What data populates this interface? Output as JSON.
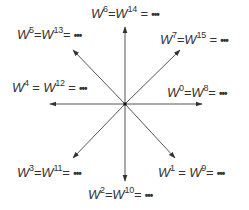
{
  "diagram": {
    "type": "unit-circle-roots",
    "center": {
      "x": 125,
      "y": 104
    },
    "line_color": "#555555",
    "center_dot_color": "#111111",
    "arrows": [
      {
        "direction": "right",
        "angle_deg": 0
      },
      {
        "direction": "lower-right",
        "angle_deg": -45
      },
      {
        "direction": "down",
        "angle_deg": -90
      },
      {
        "direction": "lower-left",
        "angle_deg": -135
      },
      {
        "direction": "left",
        "angle_deg": 180
      },
      {
        "direction": "upper-left",
        "angle_deg": 135
      },
      {
        "direction": "up",
        "angle_deg": 90
      },
      {
        "direction": "upper-right",
        "angle_deg": 45
      }
    ],
    "labels": [
      {
        "id": "w0",
        "base": "W",
        "exp1": "0",
        "exp2": "8",
        "eq": "=",
        "ellipsis": "•••"
      },
      {
        "id": "w1",
        "base": "W",
        "exp1": "1",
        "exp2": "9",
        "eq": "=",
        "ellipsis": "•••"
      },
      {
        "id": "w2",
        "base": "W",
        "exp1": "2",
        "exp2": "10",
        "eq": "=",
        "ellipsis": "•••"
      },
      {
        "id": "w3",
        "base": "W",
        "exp1": "3",
        "exp2": "11",
        "eq": "=",
        "ellipsis": "•••"
      },
      {
        "id": "w4",
        "base": "W",
        "exp1": "4",
        "exp2": "12",
        "eq": "=",
        "ellipsis": "•••"
      },
      {
        "id": "w5",
        "base": "W",
        "exp1": "5",
        "exp2": "13",
        "eq": "=",
        "ellipsis": "•••"
      },
      {
        "id": "w6",
        "base": "W",
        "exp1": "6",
        "exp2": "14",
        "eq": "=",
        "ellipsis": "•••"
      },
      {
        "id": "w7",
        "base": "W",
        "exp1": "7",
        "exp2": "15",
        "eq": "=",
        "ellipsis": "•••"
      }
    ]
  }
}
